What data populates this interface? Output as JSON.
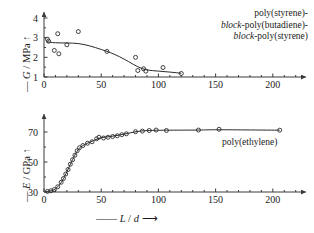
{
  "figure": {
    "background": "#ffffff",
    "ink_color": "#2b2b2b"
  },
  "chart_data": [
    {
      "id": "top",
      "type": "scatter",
      "title": "",
      "subtitle": "",
      "xlabel": "L / d",
      "ylabel": "G / MPa",
      "xlim": [
        0,
        222
      ],
      "ylim": [
        1,
        4
      ],
      "xticks": [
        0,
        50,
        100,
        150,
        200
      ],
      "xticklabels": [
        "0",
        "50",
        "100",
        "150",
        "200"
      ],
      "yticks": [
        1,
        2,
        3,
        4
      ],
      "yticklabels": [
        "1",
        "2",
        "3",
        "4"
      ],
      "grid": false,
      "legend_position": "upper-right",
      "annotation": "poly(styrene)-block-poly(butadiene)-block-poly(styrene)",
      "annotation_lines": [
        {
          "pre": "",
          "italic": "",
          "post": "poly(styrene)-"
        },
        {
          "pre": "",
          "italic": "block",
          "post": "-poly(butadiene)-"
        },
        {
          "pre": "",
          "italic": "block",
          "post": "-poly(styrene)"
        }
      ],
      "marker": "open-circle",
      "points": [
        {
          "x": 3,
          "y": 2.92
        },
        {
          "x": 4,
          "y": 2.82
        },
        {
          "x": 9,
          "y": 2.35
        },
        {
          "x": 12,
          "y": 3.2
        },
        {
          "x": 13,
          "y": 2.18
        },
        {
          "x": 20,
          "y": 2.64
        },
        {
          "x": 30,
          "y": 3.31
        },
        {
          "x": 55,
          "y": 2.3
        },
        {
          "x": 80,
          "y": 2.0
        },
        {
          "x": 82,
          "y": 1.33
        },
        {
          "x": 87,
          "y": 1.42
        },
        {
          "x": 89,
          "y": 1.3
        },
        {
          "x": 104,
          "y": 1.48
        },
        {
          "x": 120,
          "y": 1.18
        }
      ],
      "fit_curve": [
        {
          "x": 2,
          "y": 2.79
        },
        {
          "x": 10,
          "y": 2.74
        },
        {
          "x": 20,
          "y": 2.73
        },
        {
          "x": 30,
          "y": 2.7
        },
        {
          "x": 40,
          "y": 2.58
        },
        {
          "x": 50,
          "y": 2.4
        },
        {
          "x": 58,
          "y": 2.24
        },
        {
          "x": 66,
          "y": 2.03
        },
        {
          "x": 74,
          "y": 1.78
        },
        {
          "x": 82,
          "y": 1.52
        },
        {
          "x": 90,
          "y": 1.36
        },
        {
          "x": 100,
          "y": 1.3
        },
        {
          "x": 110,
          "y": 1.25
        },
        {
          "x": 120,
          "y": 1.19
        }
      ]
    },
    {
      "id": "bottom",
      "type": "scatter",
      "title": "",
      "subtitle": "",
      "xlabel": "L / d",
      "ylabel": "E / GPa",
      "xlim": [
        0,
        222
      ],
      "ylim": [
        30,
        78
      ],
      "xticks": [
        0,
        50,
        100,
        150,
        200
      ],
      "xticklabels": [
        "0",
        "50",
        "100",
        "150",
        "200"
      ],
      "yticks": [
        30,
        50,
        70
      ],
      "yticklabels": [
        "30",
        "50",
        "70"
      ],
      "grid": false,
      "legend_position": "right",
      "annotation": "poly(ethylene)",
      "marker": "open-circle",
      "points": [
        {
          "x": 3,
          "y": 30.4
        },
        {
          "x": 6,
          "y": 30.8
        },
        {
          "x": 9,
          "y": 31.6
        },
        {
          "x": 12,
          "y": 33.5
        },
        {
          "x": 15,
          "y": 36.5
        },
        {
          "x": 17,
          "y": 39.0
        },
        {
          "x": 19,
          "y": 42.0
        },
        {
          "x": 21,
          "y": 45.0
        },
        {
          "x": 23,
          "y": 48.5
        },
        {
          "x": 25,
          "y": 51.5
        },
        {
          "x": 27,
          "y": 54.5
        },
        {
          "x": 29,
          "y": 57.5
        },
        {
          "x": 31,
          "y": 59.5
        },
        {
          "x": 34,
          "y": 61.0
        },
        {
          "x": 38,
          "y": 62.5
        },
        {
          "x": 42,
          "y": 63.5
        },
        {
          "x": 46,
          "y": 65.5
        },
        {
          "x": 48,
          "y": 66.5
        },
        {
          "x": 52,
          "y": 66.0
        },
        {
          "x": 56,
          "y": 66.5
        },
        {
          "x": 60,
          "y": 67.0
        },
        {
          "x": 64,
          "y": 67.5
        },
        {
          "x": 68,
          "y": 68.2
        },
        {
          "x": 72,
          "y": 68.8
        },
        {
          "x": 80,
          "y": 70.2
        },
        {
          "x": 86,
          "y": 70.6
        },
        {
          "x": 92,
          "y": 71.0
        },
        {
          "x": 98,
          "y": 71.3
        },
        {
          "x": 107,
          "y": 71.0
        },
        {
          "x": 135,
          "y": 71.3
        },
        {
          "x": 153,
          "y": 71.8
        },
        {
          "x": 206,
          "y": 71.2
        }
      ],
      "fit_curve": [
        {
          "x": 2,
          "y": 30.3
        },
        {
          "x": 8,
          "y": 31.2
        },
        {
          "x": 12,
          "y": 33.5
        },
        {
          "x": 16,
          "y": 37.5
        },
        {
          "x": 20,
          "y": 43.5
        },
        {
          "x": 24,
          "y": 50.0
        },
        {
          "x": 28,
          "y": 56.0
        },
        {
          "x": 32,
          "y": 60.0
        },
        {
          "x": 38,
          "y": 62.5
        },
        {
          "x": 44,
          "y": 64.5
        },
        {
          "x": 50,
          "y": 66.2
        },
        {
          "x": 58,
          "y": 67.0
        },
        {
          "x": 66,
          "y": 68.0
        },
        {
          "x": 74,
          "y": 69.2
        },
        {
          "x": 82,
          "y": 70.4
        },
        {
          "x": 92,
          "y": 71.0
        },
        {
          "x": 107,
          "y": 71.2
        },
        {
          "x": 135,
          "y": 71.3
        },
        {
          "x": 153,
          "y": 71.5
        },
        {
          "x": 206,
          "y": 71.2
        }
      ]
    }
  ],
  "axis_labels": {
    "top_y": {
      "dash": "—",
      "symbol": "G",
      "unit": " / MPa",
      "arrow": "↑"
    },
    "bottom_y": {
      "dash": "—",
      "symbol": "E",
      "unit": " / GPa",
      "arrow": "↑"
    },
    "bottom_x": {
      "dash": "——",
      "symbol": "L",
      "sep": " / ",
      "symbol2": "d",
      "arrow": "⟶"
    }
  }
}
